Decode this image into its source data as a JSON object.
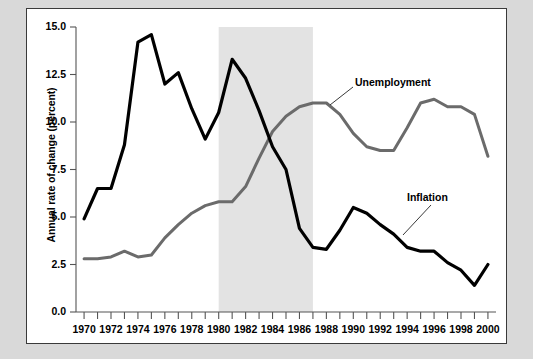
{
  "figure": {
    "background_color": "#d9d9d9",
    "panel_color": "#ffffff",
    "border_color": "#3a3a3a"
  },
  "axis": {
    "y_title": "Annual rate of change (percent)",
    "y_ticks": [
      "0.0",
      "2.5",
      "5.0",
      "7.5",
      "10.0",
      "12.5",
      "15.0"
    ],
    "x_ticks": [
      "1970",
      "1972",
      "1974",
      "1976",
      "1978",
      "1980",
      "1982",
      "1984",
      "1986",
      "1988",
      "1990",
      "1992",
      "1994",
      "1996",
      "1998",
      "2000"
    ]
  },
  "labels": {
    "unemployment": "Unemployment",
    "inflation": "Inflation"
  },
  "chart_data": {
    "type": "line",
    "title": "",
    "xlabel": "",
    "ylabel": "Annual rate of change (percent)",
    "xlim": [
      1969.4,
      2000.6
    ],
    "ylim": [
      0.0,
      15.0
    ],
    "y_ticks": [
      0.0,
      2.5,
      5.0,
      7.5,
      10.0,
      12.5,
      15.0
    ],
    "x_tick_years": [
      1970,
      1971,
      1972,
      1973,
      1974,
      1975,
      1976,
      1977,
      1978,
      1979,
      1980,
      1981,
      1982,
      1983,
      1984,
      1985,
      1986,
      1987,
      1988,
      1989,
      1990,
      1991,
      1992,
      1993,
      1994,
      1995,
      1996,
      1997,
      1998,
      1999,
      2000
    ],
    "x_labeled_years": [
      1970,
      1972,
      1974,
      1976,
      1978,
      1980,
      1982,
      1984,
      1986,
      1988,
      1990,
      1992,
      1994,
      1996,
      1998,
      2000
    ],
    "grid": false,
    "legend": "inline-annotations",
    "shaded_region": {
      "label": "",
      "x_start": 1980,
      "x_end": 1987,
      "color": "#e3e3e3"
    },
    "x": [
      1970,
      1971,
      1972,
      1973,
      1974,
      1975,
      1976,
      1977,
      1978,
      1979,
      1980,
      1981,
      1982,
      1983,
      1984,
      1985,
      1986,
      1987,
      1988,
      1989,
      1990,
      1991,
      1992,
      1993,
      1994,
      1995,
      1996,
      1997,
      1998,
      1999,
      2000
    ],
    "series": [
      {
        "name": "Inflation",
        "color": "#000000",
        "width": 3.2,
        "values": [
          4.9,
          6.5,
          6.5,
          8.8,
          14.2,
          14.6,
          12.0,
          12.6,
          10.7,
          9.1,
          10.5,
          13.3,
          12.3,
          10.6,
          8.7,
          7.5,
          4.4,
          3.4,
          3.3,
          4.3,
          5.5,
          5.2,
          4.6,
          4.1,
          3.4,
          3.2,
          3.2,
          2.6,
          2.2,
          1.4,
          2.5
        ]
      },
      {
        "name": "Unemployment",
        "color": "#6b6b6b",
        "width": 3.0,
        "values": [
          2.8,
          2.8,
          2.9,
          3.2,
          2.9,
          3.0,
          3.9,
          4.6,
          5.2,
          5.6,
          5.8,
          5.8,
          6.6,
          8.1,
          9.5,
          10.3,
          10.8,
          11.0,
          11.0,
          10.4,
          9.4,
          8.7,
          8.5,
          8.5,
          9.7,
          11.0,
          11.2,
          10.8,
          10.8,
          10.4,
          8.2
        ]
      }
    ]
  }
}
